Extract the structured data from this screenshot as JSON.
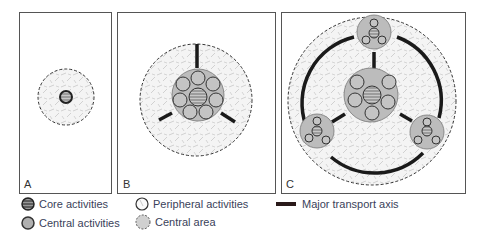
{
  "panels": [
    {
      "id": "A",
      "label": "A"
    },
    {
      "id": "B",
      "label": "B"
    },
    {
      "id": "C",
      "label": "C"
    }
  ],
  "legend": {
    "core": "Core activities",
    "central_activities": "Central activities",
    "peripheral": "Peripheral activities",
    "central_area": "Central area",
    "transport": "Major transport axis"
  },
  "colors": {
    "frame": "#555555",
    "core_fill": "#8a8a8a",
    "central_fill": "#bdbdbd",
    "central_area_fill": "#d0d0d0",
    "transport": "#1a1a1a",
    "dash": "#333333"
  }
}
